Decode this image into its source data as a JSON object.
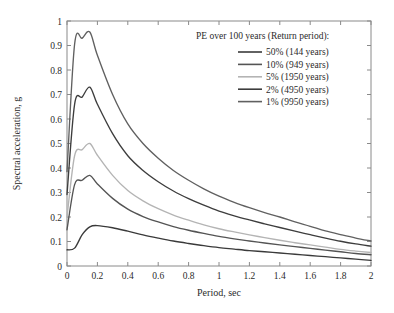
{
  "chart_data": {
    "type": "line",
    "title": "",
    "xlabel": "Period, sec",
    "ylabel": "Spectral acceleration, g",
    "xlim": [
      0,
      2
    ],
    "ylim": [
      0,
      1
    ],
    "xticks": [
      "0",
      "0.2",
      "0.4",
      "0.6",
      "0.8",
      "1",
      "1.2",
      "1.4",
      "1.6",
      "1.8",
      "2"
    ],
    "xtick_values": [
      0,
      0.2,
      0.4,
      0.6,
      0.8,
      1.0,
      1.2,
      1.4,
      1.6,
      1.8,
      2.0
    ],
    "yticks": [
      "0",
      "0.1",
      "0.2",
      "0.3",
      "0.4",
      "0.5",
      "0.6",
      "0.7",
      "0.8",
      "0.9",
      "1"
    ],
    "ytick_values": [
      0,
      0.1,
      0.2,
      0.3,
      0.4,
      0.5,
      0.6,
      0.7,
      0.8,
      0.9,
      1.0
    ],
    "grid": false,
    "legend_position": "top-right",
    "legend_title": "PE over 100 years (Return period):",
    "x": [
      0,
      0.05,
      0.1,
      0.15,
      0.2,
      0.3,
      0.4,
      0.5,
      0.6,
      0.7,
      0.8,
      0.9,
      1.0,
      1.1,
      1.2,
      1.3,
      1.4,
      1.5,
      1.6,
      1.7,
      1.8,
      1.9,
      2.0
    ],
    "series": [
      {
        "name": "1% (9950 years)",
        "label": "1% (9950 years)",
        "color": "#606060",
        "values": [
          0.385,
          0.905,
          0.93,
          0.955,
          0.86,
          0.7,
          0.58,
          0.5,
          0.44,
          0.39,
          0.35,
          0.315,
          0.285,
          0.26,
          0.238,
          0.218,
          0.2,
          0.18,
          0.162,
          0.143,
          0.128,
          0.114,
          0.102
        ]
      },
      {
        "name": "2% (4950 years)",
        "label": "2% (4950 years)",
        "color": "#3d3d3d",
        "values": [
          0.292,
          0.66,
          0.69,
          0.73,
          0.66,
          0.54,
          0.45,
          0.39,
          0.344,
          0.306,
          0.275,
          0.248,
          0.224,
          0.205,
          0.188,
          0.172,
          0.157,
          0.142,
          0.128,
          0.114,
          0.101,
          0.09,
          0.081
        ]
      },
      {
        "name": "5% (1950 years)",
        "label": "5% (1950 years)",
        "color": "#b4b4b4",
        "values": [
          0.2,
          0.45,
          0.475,
          0.5,
          0.452,
          0.37,
          0.308,
          0.266,
          0.234,
          0.208,
          0.187,
          0.168,
          0.152,
          0.139,
          0.127,
          0.116,
          0.105,
          0.095,
          0.086,
          0.077,
          0.068,
          0.061,
          0.055
        ]
      },
      {
        "name": "10% (949 years)",
        "label": "10% (949 years)",
        "color": "#545454",
        "values": [
          0.148,
          0.332,
          0.35,
          0.37,
          0.335,
          0.276,
          0.232,
          0.202,
          0.18,
          0.161,
          0.146,
          0.133,
          0.121,
          0.111,
          0.102,
          0.094,
          0.086,
          0.079,
          0.072,
          0.065,
          0.058,
          0.051,
          0.046
        ]
      },
      {
        "name": "50% (144 years)",
        "label": "50% (144 years)",
        "color": "#3a3a3a",
        "values": [
          0.066,
          0.073,
          0.128,
          0.16,
          0.165,
          0.156,
          0.142,
          0.127,
          0.114,
          0.102,
          0.092,
          0.083,
          0.075,
          0.069,
          0.063,
          0.058,
          0.053,
          0.048,
          0.043,
          0.038,
          0.033,
          0.028,
          0.023
        ]
      }
    ],
    "legend_entries": [
      {
        "label": "50% (144 years)",
        "color": "#3a3a3a"
      },
      {
        "label": "10% (949 years)",
        "color": "#545454"
      },
      {
        "label": "5% (1950 years)",
        "color": "#b4b4b4"
      },
      {
        "label": "2% (4950 years)",
        "color": "#3d3d3d"
      },
      {
        "label": "1% (9950 years)",
        "color": "#606060"
      }
    ]
  }
}
